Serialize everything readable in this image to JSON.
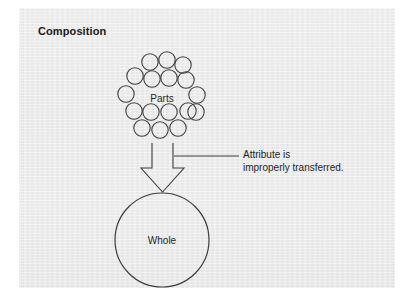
{
  "figure": {
    "title": "Composition",
    "background_color": "#ffffff",
    "panel_color": "#eeeeee",
    "stroke_color": "#3d3d3d",
    "text_color": "#1f1f1f"
  },
  "nodes": {
    "parts": {
      "label": "Parts",
      "shape": "circle-cluster",
      "center_x": 162,
      "center_y": 98,
      "circle_radius": 8.2,
      "circle_count": 17,
      "circles": [
        {
          "cx": 150,
          "cy": 62
        },
        {
          "cx": 167,
          "cy": 60
        },
        {
          "cx": 183,
          "cy": 65
        },
        {
          "cx": 135,
          "cy": 76
        },
        {
          "cx": 152,
          "cy": 79
        },
        {
          "cx": 169,
          "cy": 78
        },
        {
          "cx": 186,
          "cy": 80
        },
        {
          "cx": 126,
          "cy": 94
        },
        {
          "cx": 197,
          "cy": 95
        },
        {
          "cx": 134,
          "cy": 111
        },
        {
          "cx": 151,
          "cy": 112
        },
        {
          "cx": 169,
          "cy": 112
        },
        {
          "cx": 188,
          "cy": 111
        },
        {
          "cx": 142,
          "cy": 128
        },
        {
          "cx": 160,
          "cy": 130
        },
        {
          "cx": 178,
          "cy": 128
        },
        {
          "cx": 196,
          "cy": 112
        }
      ]
    },
    "whole": {
      "label": "Whole",
      "shape": "circle",
      "center_x": 162,
      "center_y": 240,
      "radius": 47
    }
  },
  "arrow": {
    "name": "composition-arrow",
    "direction": "down",
    "style": "hollow-block-arrow",
    "from_node": "parts",
    "to_node": "whole",
    "shaft_left_x": 152,
    "shaft_right_x": 173,
    "top_y": 143,
    "head_top_y": 168,
    "head_left_x": 141,
    "head_right_x": 184,
    "tip_y": 192
  },
  "annotation": {
    "line1": "Attribute is",
    "line2": "improperly transferred.",
    "leader_line": {
      "x1": 174,
      "y1": 156,
      "x2": 239,
      "y2": 156
    }
  }
}
